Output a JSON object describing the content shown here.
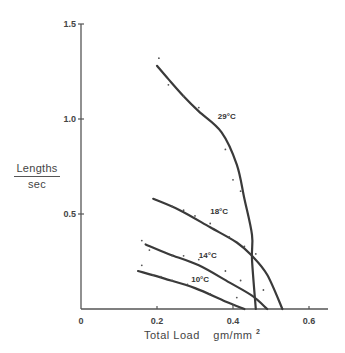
{
  "chart_data": {
    "type": "line",
    "title": "",
    "xlabel": "Total Load gm/mm²",
    "ylabel": "Lengths/sec",
    "ylabel_numerator": "Lengths",
    "ylabel_denominator": "sec",
    "xlim": [
      0,
      0.65
    ],
    "ylim": [
      0,
      1.5
    ],
    "x_ticks": [
      "0",
      "0.2",
      "0.4",
      "0.6"
    ],
    "x_tick_values": [
      0,
      0.2,
      0.4,
      0.6
    ],
    "y_ticks": [
      "0.5",
      "1.0",
      "1.5"
    ],
    "y_tick_values": [
      0.5,
      1.0,
      1.5
    ],
    "grid": false,
    "legend": "inline curve labels",
    "series": [
      {
        "name": "29°C",
        "label_pos": [
          0.36,
          1.0
        ],
        "x": [
          0.2,
          0.23,
          0.27,
          0.31,
          0.37,
          0.41,
          0.43,
          0.45,
          0.45,
          0.46
        ],
        "y": [
          1.28,
          1.21,
          1.12,
          1.04,
          0.93,
          0.76,
          0.58,
          0.39,
          0.26,
          0.0
        ],
        "points": [
          [
            0.205,
            1.32
          ],
          [
            0.23,
            1.18
          ],
          [
            0.27,
            1.12
          ],
          [
            0.31,
            1.06
          ],
          [
            0.4,
            0.68
          ],
          [
            0.42,
            0.62
          ],
          [
            0.38,
            0.84
          ]
        ]
      },
      {
        "name": "18°C",
        "label_pos": [
          0.34,
          0.5
        ],
        "x": [
          0.19,
          0.26,
          0.34,
          0.41,
          0.45,
          0.49,
          0.53
        ],
        "y": [
          0.58,
          0.52,
          0.43,
          0.35,
          0.28,
          0.18,
          0.0
        ],
        "points": [
          [
            0.24,
            0.54
          ],
          [
            0.27,
            0.52
          ],
          [
            0.3,
            0.49
          ],
          [
            0.34,
            0.45
          ],
          [
            0.39,
            0.38
          ],
          [
            0.43,
            0.33
          ],
          [
            0.46,
            0.29
          ]
        ]
      },
      {
        "name": "14°C",
        "label_pos": [
          0.31,
          0.27
        ],
        "x": [
          0.17,
          0.23,
          0.31,
          0.39,
          0.45,
          0.49
        ],
        "y": [
          0.34,
          0.29,
          0.23,
          0.14,
          0.07,
          0.0
        ],
        "points": [
          [
            0.16,
            0.36
          ],
          [
            0.18,
            0.31
          ],
          [
            0.24,
            0.28
          ],
          [
            0.27,
            0.28
          ],
          [
            0.31,
            0.26
          ],
          [
            0.38,
            0.2
          ],
          [
            0.42,
            0.15
          ],
          [
            0.48,
            0.1
          ]
        ]
      },
      {
        "name": "10°C",
        "label_pos": [
          0.29,
          0.14
        ],
        "x": [
          0.15,
          0.22,
          0.3,
          0.38,
          0.43
        ],
        "y": [
          0.2,
          0.16,
          0.11,
          0.04,
          0.0
        ],
        "points": [
          [
            0.16,
            0.23
          ],
          [
            0.19,
            0.18
          ],
          [
            0.21,
            0.17
          ],
          [
            0.24,
            0.15
          ],
          [
            0.28,
            0.13
          ],
          [
            0.34,
            0.08
          ],
          [
            0.41,
            0.06
          ],
          [
            0.4,
            0.02
          ]
        ]
      }
    ]
  },
  "labels": {
    "xlabel_main": "Total   Load",
    "xlabel_unit": "gm/mm",
    "xlabel_sup": "2",
    "ylabel_num": "Lengths",
    "ylabel_den": "sec"
  },
  "style": {
    "line_color": "#3a3a3a",
    "axis_color": "#555555",
    "background": "#ffffff"
  }
}
